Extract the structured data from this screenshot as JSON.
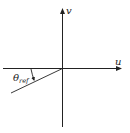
{
  "diagram": {
    "axes": {
      "horizontal_label": "u",
      "vertical_label": "v"
    },
    "angle": {
      "symbol": "θ",
      "subscript": "ref"
    },
    "colors": {
      "stroke": "#222222",
      "background": "#ffffff"
    }
  }
}
